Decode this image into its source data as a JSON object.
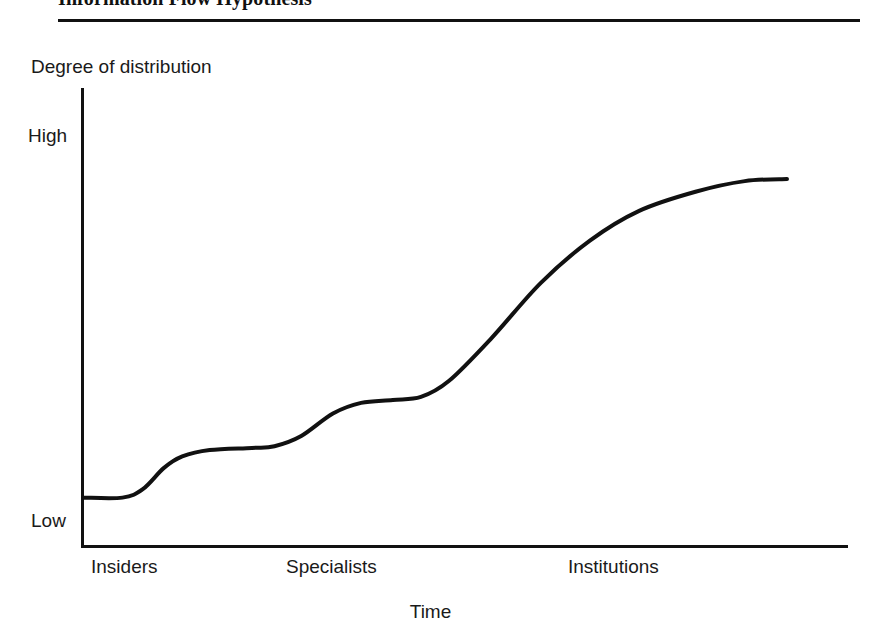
{
  "figure": {
    "title": "Information Flow Hypothesis"
  },
  "chart_data": {
    "type": "line",
    "title": "Information Flow Hypothesis",
    "xlabel": "Time",
    "ylabel": "Degree of distribution",
    "grid": false,
    "legend": null,
    "x_tick_labels": [
      "Insiders",
      "Specialists",
      "Institutions"
    ],
    "y_tick_labels": [
      "Low",
      "High"
    ],
    "ylim": [
      0,
      1
    ],
    "xlim": [
      0,
      1
    ],
    "series": [
      {
        "name": "Degree of distribution over time",
        "color": "#111111",
        "points": [
          {
            "x": 0.0,
            "y": 0.055
          },
          {
            "x": 0.056,
            "y": 0.055
          },
          {
            "x": 0.085,
            "y": 0.075
          },
          {
            "x": 0.115,
            "y": 0.125
          },
          {
            "x": 0.141,
            "y": 0.152
          },
          {
            "x": 0.18,
            "y": 0.167
          },
          {
            "x": 0.24,
            "y": 0.172
          },
          {
            "x": 0.272,
            "y": 0.176
          },
          {
            "x": 0.31,
            "y": 0.2
          },
          {
            "x": 0.355,
            "y": 0.253
          },
          {
            "x": 0.395,
            "y": 0.278
          },
          {
            "x": 0.44,
            "y": 0.285
          },
          {
            "x": 0.48,
            "y": 0.292
          },
          {
            "x": 0.52,
            "y": 0.33
          },
          {
            "x": 0.58,
            "y": 0.43
          },
          {
            "x": 0.65,
            "y": 0.56
          },
          {
            "x": 0.72,
            "y": 0.66
          },
          {
            "x": 0.79,
            "y": 0.73
          },
          {
            "x": 0.87,
            "y": 0.775
          },
          {
            "x": 0.94,
            "y": 0.8
          },
          {
            "x": 1.0,
            "y": 0.805
          }
        ]
      }
    ]
  }
}
